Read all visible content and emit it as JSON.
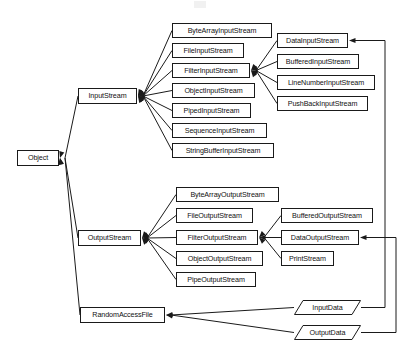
{
  "diagram": {
    "type": "class-hierarchy",
    "canvas": {
      "width": 403,
      "height": 354
    },
    "line_color": "#1a1a1a",
    "box_fill": "#ffffff",
    "text_color": "#111111",
    "nodes": [
      {
        "id": "object",
        "label": "Object",
        "shape": "rect",
        "x": 17,
        "y": 150,
        "w": 42,
        "h": 16
      },
      {
        "id": "input_stream",
        "label": "InputStream",
        "shape": "rect",
        "x": 78,
        "y": 88,
        "w": 59,
        "h": 16
      },
      {
        "id": "output_stream",
        "label": "OutputStream",
        "shape": "rect",
        "x": 78,
        "y": 230,
        "w": 63,
        "h": 16
      },
      {
        "id": "random_access_file",
        "label": "RandomAccessFile",
        "shape": "rect",
        "x": 80,
        "y": 307,
        "w": 85,
        "h": 16
      },
      {
        "id": "byte_array_input",
        "label": "ByteArrayInputStream",
        "shape": "rect",
        "x": 172,
        "y": 23,
        "w": 100,
        "h": 15
      },
      {
        "id": "file_input",
        "label": "FileInputStream",
        "shape": "rect",
        "x": 172,
        "y": 43,
        "w": 72,
        "h": 15
      },
      {
        "id": "filter_input",
        "label": "FilterInputStream",
        "shape": "rect",
        "x": 172,
        "y": 63,
        "w": 78,
        "h": 15
      },
      {
        "id": "object_input",
        "label": "ObjectInputStream",
        "shape": "rect",
        "x": 172,
        "y": 83,
        "w": 83,
        "h": 15
      },
      {
        "id": "piped_input",
        "label": "PipedInputStream",
        "shape": "rect",
        "x": 172,
        "y": 103,
        "w": 79,
        "h": 15
      },
      {
        "id": "sequence_input",
        "label": "SequenceInputStream",
        "shape": "rect",
        "x": 172,
        "y": 123,
        "w": 95,
        "h": 15
      },
      {
        "id": "string_buffer_input",
        "label": "StringBufferInputStream",
        "shape": "rect",
        "x": 172,
        "y": 143,
        "w": 102,
        "h": 15
      },
      {
        "id": "data_input",
        "label": "DataInputStream",
        "shape": "rect",
        "x": 277,
        "y": 33,
        "w": 71,
        "h": 15
      },
      {
        "id": "buffered_input",
        "label": "BufferedInputStream",
        "shape": "rect",
        "x": 277,
        "y": 54,
        "w": 82,
        "h": 15
      },
      {
        "id": "line_number_input",
        "label": "LineNumberInputStream",
        "shape": "rect",
        "x": 277,
        "y": 75,
        "w": 98,
        "h": 15
      },
      {
        "id": "push_back_input",
        "label": "PushBackInputStream",
        "shape": "rect",
        "x": 277,
        "y": 96,
        "w": 91,
        "h": 15
      },
      {
        "id": "byte_array_output",
        "label": "ByteArrayOutputStream",
        "shape": "rect",
        "x": 176,
        "y": 187,
        "w": 103,
        "h": 15
      },
      {
        "id": "file_output",
        "label": "FileOutputStream",
        "shape": "rect",
        "x": 176,
        "y": 208,
        "w": 77,
        "h": 15
      },
      {
        "id": "filter_output",
        "label": "FilterOutputStream",
        "shape": "rect",
        "x": 176,
        "y": 230,
        "w": 82,
        "h": 15
      },
      {
        "id": "object_output",
        "label": "ObjectOutputStream",
        "shape": "rect",
        "x": 176,
        "y": 251,
        "w": 87,
        "h": 15
      },
      {
        "id": "pipe_output",
        "label": "PipeOutputStream",
        "shape": "rect",
        "x": 176,
        "y": 272,
        "w": 80,
        "h": 15
      },
      {
        "id": "buffered_output",
        "label": "BufferedOutputStream",
        "shape": "rect",
        "x": 281,
        "y": 208,
        "w": 92,
        "h": 15
      },
      {
        "id": "data_output",
        "label": "DataOutputStream",
        "shape": "rect",
        "x": 281,
        "y": 230,
        "w": 78,
        "h": 15
      },
      {
        "id": "print_stream",
        "label": "PrintStream",
        "shape": "rect",
        "x": 281,
        "y": 251,
        "w": 53,
        "h": 15
      },
      {
        "id": "input_data",
        "label": "InputData",
        "shape": "parallelogram",
        "x": 294,
        "y": 300,
        "w": 67,
        "h": 15
      },
      {
        "id": "output_data",
        "label": "OutputData",
        "shape": "parallelogram",
        "x": 294,
        "y": 325,
        "w": 67,
        "h": 15
      }
    ],
    "edges": [
      {
        "from": "input_stream",
        "to": "object",
        "arrow": true
      },
      {
        "from": "output_stream",
        "to": "object",
        "arrow": true
      },
      {
        "from": "random_access_file",
        "to": "object",
        "arrow": true
      },
      {
        "from": "byte_array_input",
        "to": "input_stream",
        "arrow": true
      },
      {
        "from": "file_input",
        "to": "input_stream",
        "arrow": true
      },
      {
        "from": "filter_input",
        "to": "input_stream",
        "arrow": true
      },
      {
        "from": "object_input",
        "to": "input_stream",
        "arrow": true
      },
      {
        "from": "piped_input",
        "to": "input_stream",
        "arrow": true
      },
      {
        "from": "sequence_input",
        "to": "input_stream",
        "arrow": true
      },
      {
        "from": "string_buffer_input",
        "to": "input_stream",
        "arrow": true
      },
      {
        "from": "data_input",
        "to": "filter_input",
        "arrow": true
      },
      {
        "from": "buffered_input",
        "to": "filter_input",
        "arrow": true
      },
      {
        "from": "line_number_input",
        "to": "filter_input",
        "arrow": true
      },
      {
        "from": "push_back_input",
        "to": "filter_input",
        "arrow": true
      },
      {
        "from": "byte_array_output",
        "to": "output_stream",
        "arrow": true
      },
      {
        "from": "file_output",
        "to": "output_stream",
        "arrow": true
      },
      {
        "from": "filter_output",
        "to": "output_stream",
        "arrow": true
      },
      {
        "from": "object_output",
        "to": "output_stream",
        "arrow": true
      },
      {
        "from": "pipe_output",
        "to": "output_stream",
        "arrow": true
      },
      {
        "from": "buffered_output",
        "to": "filter_output",
        "arrow": true
      },
      {
        "from": "data_output",
        "to": "filter_output",
        "arrow": true
      },
      {
        "from": "print_stream",
        "to": "filter_output",
        "arrow": true
      },
      {
        "from": "input_data",
        "to": "random_access_file",
        "arrow": true
      },
      {
        "from": "output_data",
        "to": "random_access_file",
        "arrow": true
      },
      {
        "from": "input_data",
        "to": "data_input",
        "arrow": true,
        "routed": true
      },
      {
        "from": "output_data",
        "to": "data_output",
        "arrow": true,
        "routed": true
      }
    ]
  }
}
